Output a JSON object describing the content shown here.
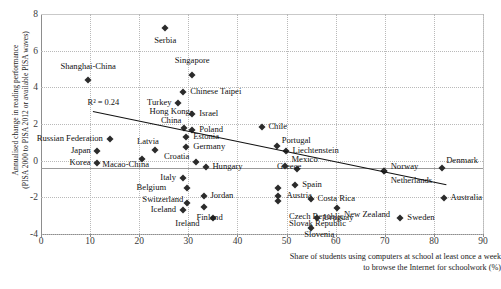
{
  "chart_data": {
    "type": "scatter",
    "title": "",
    "xlabel": "Share of students using computers at school at least once a week to browse the Internet for schoolwork (%)",
    "ylabel": "Annualised change in reading performance (PISA 2000 to PISA 2012 or available PISA waves)",
    "xlabel_line1": "Share of students using computers at school at least once a week",
    "xlabel_line2": "to browse the Internet for schoolwork (%)",
    "ylabel_line1": "Annualised change in reading performance",
    "ylabel_line2": "(PISA 2000 to PISA 2012 or available PISA waves)",
    "xlim": [
      0,
      90
    ],
    "ylim": [
      -4,
      8
    ],
    "xticks": [
      0,
      10,
      20,
      30,
      40,
      50,
      60,
      70,
      80,
      90
    ],
    "yticks": [
      -4,
      -2,
      0,
      2,
      4,
      6,
      8
    ],
    "grid": true,
    "legend": "none",
    "annotation": "R² = 0.24",
    "trendline": {
      "x_start": 10.5,
      "y_start": 2.7,
      "x_end": 82.5,
      "y_end": -1.3
    },
    "points": [
      {
        "label": "Serbia",
        "x": 25.3,
        "y": 7.25,
        "lx": 25.3,
        "ly": 6.55,
        "align": "c"
      },
      {
        "label": "Singapore",
        "x": 30.8,
        "y": 4.65,
        "lx": 30.8,
        "ly": 5.45,
        "align": "c"
      },
      {
        "label": "Shanghai-China",
        "x": 9.6,
        "y": 4.4,
        "lx": 9.6,
        "ly": 5.1,
        "align": "c"
      },
      {
        "label": "Chinese Taipei",
        "x": 28.9,
        "y": 3.75,
        "lx": 30.4,
        "ly": 3.75,
        "align": "l"
      },
      {
        "label": "Turkey",
        "x": 27.9,
        "y": 3.15,
        "lx": 26.6,
        "ly": 3.15,
        "align": "r"
      },
      {
        "label": "Israel",
        "x": 30.8,
        "y": 2.55,
        "lx": 32.2,
        "ly": 2.55,
        "align": "l"
      },
      {
        "label": "Chile",
        "x": 44.9,
        "y": 1.85,
        "lx": 46.3,
        "ly": 1.85,
        "align": "l"
      },
      {
        "label": "Hong Kong-China",
        "x": 29.2,
        "y": 1.8,
        "lx": 26.5,
        "ly": 2.45,
        "align": "two"
      },
      {
        "label": "Poland",
        "x": 30.8,
        "y": 1.65,
        "lx": 32.2,
        "ly": 1.65,
        "align": "l"
      },
      {
        "label": "Estonia",
        "x": 29.6,
        "y": 1.3,
        "lx": 31.0,
        "ly": 1.3,
        "align": "l"
      },
      {
        "label": "Germany",
        "x": 29.6,
        "y": 0.75,
        "lx": 31.0,
        "ly": 0.75,
        "align": "l"
      },
      {
        "label": "Portugal",
        "x": 48.0,
        "y": 0.8,
        "lx": 49.0,
        "ly": 1.05,
        "align": "l"
      },
      {
        "label": "Liechtenstein",
        "x": 49.8,
        "y": 0.55,
        "lx": 51.2,
        "ly": 0.55,
        "align": "l"
      },
      {
        "label": "Russian Federation",
        "x": 14.0,
        "y": 1.2,
        "lx": 12.6,
        "ly": 1.2,
        "align": "r"
      },
      {
        "label": "Latvia",
        "x": 23.3,
        "y": 0.6,
        "lx": 24.0,
        "ly": 1.0,
        "align": "r"
      },
      {
        "label": "Japan",
        "x": 11.4,
        "y": 0.55,
        "lx": 10.1,
        "ly": 0.55,
        "align": "r"
      },
      {
        "label": "Korea",
        "x": 11.4,
        "y": -0.1,
        "lx": 10.1,
        "ly": -0.1,
        "align": "r"
      },
      {
        "label": "Macao-China",
        "x": 20.6,
        "y": 0.1,
        "lx": 22.0,
        "ly": -0.25,
        "align": "r"
      },
      {
        "label": "Croatia",
        "x": 31.6,
        "y": -0.05,
        "lx": 30.2,
        "ly": 0.2,
        "align": "r"
      },
      {
        "label": "Hungary",
        "x": 33.5,
        "y": -0.35,
        "lx": 34.9,
        "ly": -0.35,
        "align": "l"
      },
      {
        "label": "Greece",
        "x": 52.2,
        "y": -0.45,
        "lx": 53.0,
        "ly": -0.35,
        "align": "r"
      },
      {
        "label": "Mexico",
        "x": 49.6,
        "y": -0.3,
        "lx": 51.0,
        "ly": 0.05,
        "align": "l"
      },
      {
        "label": "Italy",
        "x": 28.9,
        "y": -0.95,
        "lx": 27.5,
        "ly": -0.95,
        "align": "r"
      },
      {
        "label": "Belgium",
        "x": 29.8,
        "y": -1.5,
        "lx": 25.5,
        "ly": -1.5,
        "align": "r"
      },
      {
        "label": "Jordan",
        "x": 33.1,
        "y": -1.95,
        "lx": 34.5,
        "ly": -1.95,
        "align": "l"
      },
      {
        "label": "Spain",
        "x": 51.8,
        "y": -1.3,
        "lx": 53.2,
        "ly": -1.3,
        "align": "l"
      },
      {
        "label": "Austria",
        "x": 48.3,
        "y": -1.5,
        "lx": 50.0,
        "ly": -1.9,
        "align": "l"
      },
      {
        "label": "Czech Republic",
        "x": 48.3,
        "y": -1.95,
        "lx": 50.5,
        "ly": -3.05,
        "align": "l"
      },
      {
        "label": "Slovak Republic",
        "x": 48.3,
        "y": -2.2,
        "lx": 50.5,
        "ly": -3.45,
        "align": "l"
      },
      {
        "label": "Switzerland",
        "x": 29.8,
        "y": -2.3,
        "lx": 29.0,
        "ly": -2.15,
        "align": "r"
      },
      {
        "label": "Iceland",
        "x": 28.9,
        "y": -2.7,
        "lx": 27.5,
        "ly": -2.7,
        "align": "r"
      },
      {
        "label": "Ireland",
        "x": 33.1,
        "y": -2.55,
        "lx": 32.3,
        "ly": -3.45,
        "align": "r"
      },
      {
        "label": "Finland",
        "x": 35.1,
        "y": -3.15,
        "lx": 37.0,
        "ly": -3.15,
        "align": "r"
      },
      {
        "label": "Costa Rica",
        "x": 54.9,
        "y": -2.1,
        "lx": 56.3,
        "ly": -2.1,
        "align": "l"
      },
      {
        "label": "Uruguay",
        "x": 56.1,
        "y": -3.1,
        "lx": 57.5,
        "ly": -3.1,
        "align": "l"
      },
      {
        "label": "Slovenia",
        "x": 55.0,
        "y": -3.65,
        "lx": 53.6,
        "ly": -4.05,
        "align": "l"
      },
      {
        "label": "New Zealand",
        "x": 60.3,
        "y": -2.6,
        "lx": 61.7,
        "ly": -2.95,
        "align": "l"
      },
      {
        "label": "Norway",
        "x": 69.8,
        "y": -0.55,
        "lx": 71.2,
        "ly": -0.35,
        "align": "l"
      },
      {
        "label": "Netherlands",
        "x": 69.8,
        "y": -0.55,
        "lx": 71.2,
        "ly": -1.1,
        "align": "l"
      },
      {
        "label": "Denmark",
        "x": 81.6,
        "y": -0.4,
        "lx": 82.5,
        "ly": 0.0,
        "align": "l"
      },
      {
        "label": "Australia",
        "x": 82.0,
        "y": -2.05,
        "lx": 83.4,
        "ly": -2.05,
        "align": "l"
      },
      {
        "label": "Sweden",
        "x": 73.2,
        "y": -3.15,
        "lx": 74.6,
        "ly": -3.15,
        "align": "l"
      }
    ]
  }
}
